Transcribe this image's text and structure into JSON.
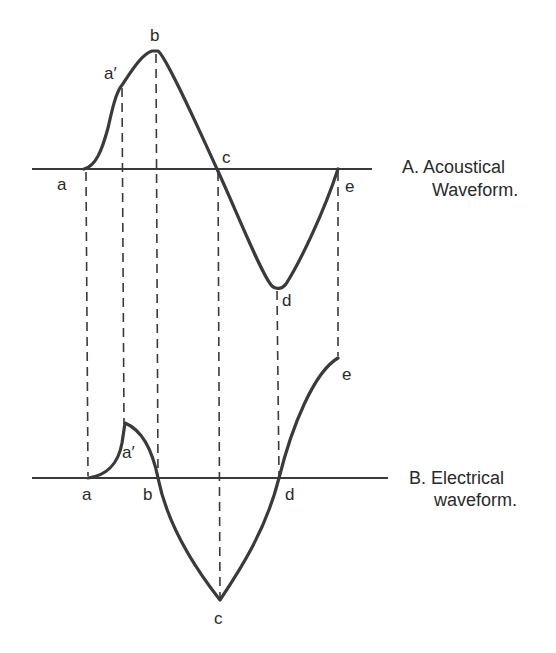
{
  "panels": {
    "acoustical": {
      "caption_line1": "A. Acoustical",
      "caption_line2": "Waveform.",
      "points": {
        "a": "a",
        "a_prime": "a′",
        "b": "b",
        "c": "c",
        "d": "d",
        "e": "e"
      }
    },
    "electrical": {
      "caption_line1": "B. Electrical",
      "caption_line2": "waveform.",
      "points": {
        "a": "a",
        "a_prime": "a′",
        "b": "b",
        "c": "c",
        "d": "d",
        "e": "e"
      }
    }
  },
  "colors": {
    "stroke": "#3a3a3a",
    "text": "#2a2a2a",
    "background": "#ffffff"
  }
}
